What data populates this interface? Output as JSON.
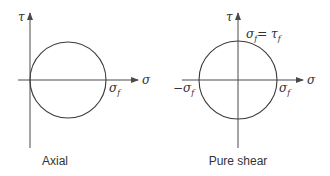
{
  "panels": [
    {
      "caption": "Axial",
      "axis_x_label": "σ",
      "axis_y_label": "τ",
      "labels": {
        "right_intercept": "σ",
        "right_intercept_sub": "f"
      }
    },
    {
      "caption": "Pure shear",
      "axis_x_label": "σ",
      "axis_y_label": "τ",
      "labels": {
        "top_left": "σ",
        "top_left_sub": "f",
        "top_eq": "= τ",
        "top_eq_sub": "f",
        "left_intercept": "−σ",
        "left_intercept_sub": "f",
        "right_intercept": "σ",
        "right_intercept_sub": "f"
      }
    }
  ],
  "colors": {
    "line": "#3a3a3a",
    "text": "#333333",
    "background": "#ffffff"
  }
}
